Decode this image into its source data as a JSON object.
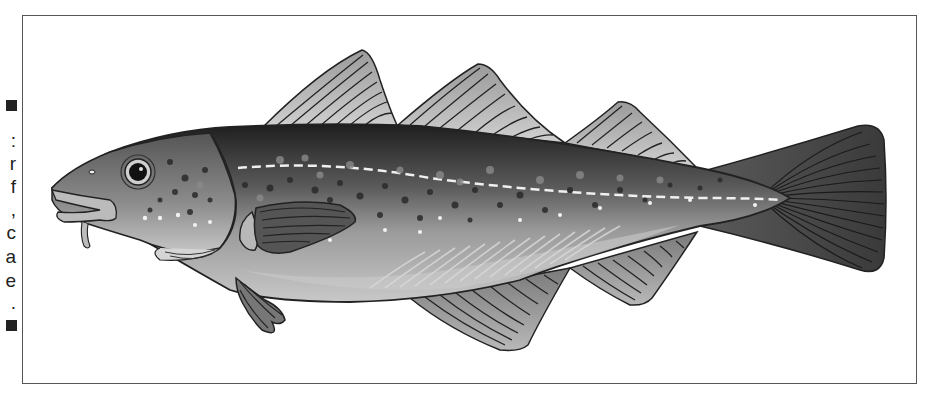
{
  "illustration": {
    "subject": "Atlantic cod illustration",
    "style": "grayscale vector drawing",
    "frame_border_color": "#555555"
  },
  "cropped_side_text": {
    "top_marker": "■",
    "characters": [
      ":",
      "r",
      "f",
      ",",
      "c",
      "a",
      "e",
      "."
    ],
    "bottom_marker": "■"
  },
  "fish_parts": {
    "dorsal_fins": 3,
    "anal_fins": 2,
    "features": [
      "eye",
      "barbel",
      "pectoral-fin",
      "pelvic-fin",
      "lateral-line",
      "spots",
      "caudal-fin"
    ]
  }
}
